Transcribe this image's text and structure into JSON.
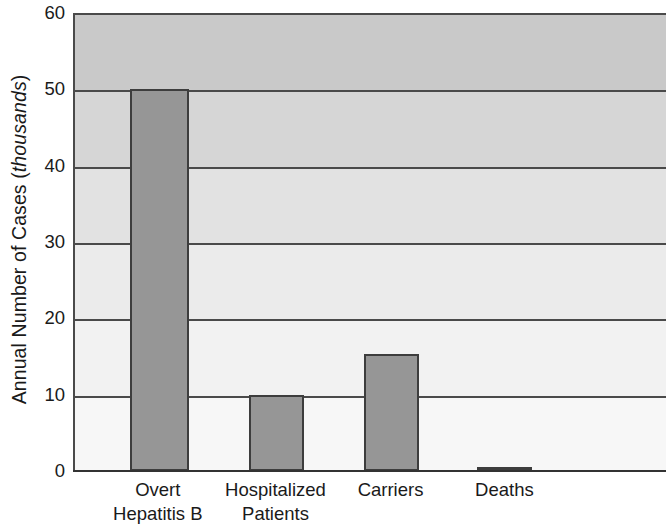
{
  "chart_data": {
    "type": "bar",
    "title": "",
    "subtitle": "",
    "xlabel": "",
    "ylabel": "Annual Number of Cases (thousands)",
    "ylabel_plain": "Annual Number of Cases (",
    "ylabel_italic": "thousands",
    "ylabel_tail": ")",
    "categories": [
      "Overt Hepatitis B",
      "Hospitalized Patients",
      "Carriers",
      "Deaths"
    ],
    "category_lines": [
      [
        "Overt",
        "Hepatitis B"
      ],
      [
        "Hospitalized",
        "Patients"
      ],
      [
        "Carriers",
        ""
      ],
      [
        "Deaths",
        ""
      ]
    ],
    "values": [
      50,
      10,
      15.3,
      0.5
    ],
    "ylim": [
      0,
      60
    ],
    "yticks": [
      0,
      10,
      20,
      30,
      40,
      50,
      60
    ],
    "ytick_labels": [
      "0",
      "10",
      "20",
      "30",
      "40",
      "50",
      "60"
    ],
    "grid": true,
    "grid_orientation": "horizontal",
    "legend": false,
    "legend_position": "none",
    "bar_color": "#969696",
    "bar_edge_color": "#3d3d3d",
    "gridline_color": "#4a4a4a",
    "axis_color": "#333333",
    "background_bands": [
      "#c9c9c9",
      "#d6d6d6",
      "#e2e2e2",
      "#ebebeb",
      "#f2f2f2",
      "#f7f7f7"
    ],
    "bar_geometry": [
      {
        "left_pct": 9.3,
        "width_pct": 10.0
      },
      {
        "left_pct": 29.5,
        "width_pct": 9.3
      },
      {
        "left_pct": 48.9,
        "width_pct": 9.3
      },
      {
        "left_pct": 68.1,
        "width_pct": 9.3
      }
    ]
  }
}
